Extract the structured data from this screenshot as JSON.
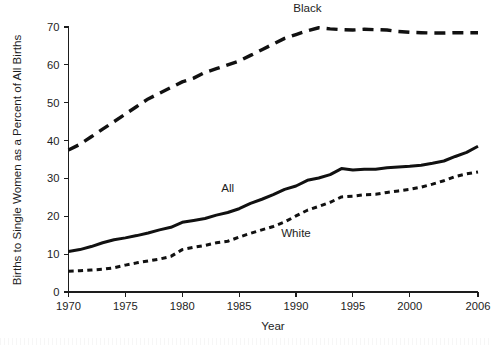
{
  "chart_data": {
    "type": "line",
    "title": "",
    "subtitle": "",
    "xlabel": "Year",
    "ylabel": "Births to Single Women as a Percent of All Births",
    "xlim": [
      1970,
      2006
    ],
    "ylim": [
      0,
      70
    ],
    "grid": false,
    "legend_position": "inline-annotations",
    "x_ticks": [
      1970,
      1975,
      1980,
      1985,
      1990,
      1995,
      2000,
      2006
    ],
    "x_tick_labels": [
      "1970",
      "1975",
      "1980",
      "1985",
      "1990",
      "1995",
      "2000",
      "2006"
    ],
    "y_ticks": [
      0,
      10,
      20,
      30,
      40,
      50,
      60,
      70
    ],
    "y_tick_labels": [
      "0",
      "10",
      "20",
      "30",
      "40",
      "50",
      "60",
      "70"
    ],
    "x": [
      1970,
      1971,
      1972,
      1973,
      1974,
      1975,
      1976,
      1977,
      1978,
      1979,
      1980,
      1981,
      1982,
      1983,
      1984,
      1985,
      1986,
      1987,
      1988,
      1989,
      1990,
      1991,
      1992,
      1993,
      1994,
      1995,
      1996,
      1997,
      1998,
      1999,
      2000,
      2001,
      2002,
      2003,
      2004,
      2005,
      2006
    ],
    "series": [
      {
        "name": "Black",
        "label": "Black",
        "style": "long-dashed",
        "color": "#111111",
        "label_x": 1991,
        "label_y": 74,
        "values": [
          37.5,
          39.0,
          41.0,
          43.0,
          45.0,
          47.0,
          49.0,
          51.0,
          52.5,
          54.0,
          55.5,
          56.5,
          58.0,
          59.0,
          60.0,
          61.0,
          62.5,
          64.0,
          65.5,
          67.0,
          68.0,
          69.0,
          69.8,
          69.5,
          69.3,
          69.2,
          69.4,
          69.3,
          69.2,
          68.8,
          68.6,
          68.5,
          68.4,
          68.4,
          68.5,
          68.5,
          68.5
        ]
      },
      {
        "name": "All",
        "label": "All",
        "style": "solid",
        "color": "#111111",
        "label_x": 1984,
        "label_y": 26.5,
        "values": [
          10.7,
          11.2,
          12.0,
          13.0,
          13.8,
          14.3,
          14.9,
          15.6,
          16.4,
          17.1,
          18.4,
          18.9,
          19.4,
          20.3,
          21.0,
          22.0,
          23.4,
          24.5,
          25.7,
          27.1,
          28.0,
          29.5,
          30.1,
          31.0,
          32.6,
          32.2,
          32.4,
          32.4,
          32.8,
          33.0,
          33.2,
          33.5,
          34.0,
          34.6,
          35.8,
          36.9,
          38.5
        ]
      },
      {
        "name": "White",
        "label": "White",
        "style": "short-dashed",
        "color": "#111111",
        "label_x": 1990,
        "label_y": 14.5,
        "values": [
          5.5,
          5.6,
          5.8,
          6.0,
          6.4,
          7.1,
          7.7,
          8.2,
          8.7,
          9.4,
          11.2,
          11.8,
          12.3,
          13.0,
          13.4,
          14.5,
          15.5,
          16.4,
          17.3,
          18.5,
          20.1,
          21.6,
          22.6,
          23.7,
          25.1,
          25.3,
          25.7,
          25.8,
          26.3,
          26.7,
          27.1,
          27.7,
          28.5,
          29.4,
          30.5,
          31.2,
          31.7
        ]
      }
    ]
  }
}
